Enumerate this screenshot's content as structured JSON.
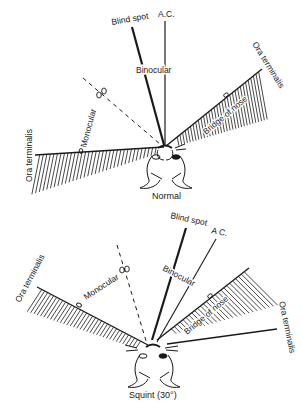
{
  "figure": {
    "panels": [
      {
        "id": "normal",
        "caption": "Normal",
        "labels": {
          "blind_spot": "Blind spot",
          "ac": "A.C.",
          "binocular": "Binocular",
          "monocular": "Monocular",
          "ora_left": "Ora terminalis",
          "ora_right": "Ora terminalis",
          "bridge": "Bridge of nose"
        }
      },
      {
        "id": "squint",
        "caption": "Squint (30°)",
        "labels": {
          "blind_spot": "Blind spot",
          "ac": "A C.",
          "binocular": "Binocular",
          "monocular": "Monocular",
          "ora_left": "Ora terminalis",
          "ora_right": "Ora terminalis",
          "bridge": "Bridge of nose"
        }
      }
    ]
  }
}
